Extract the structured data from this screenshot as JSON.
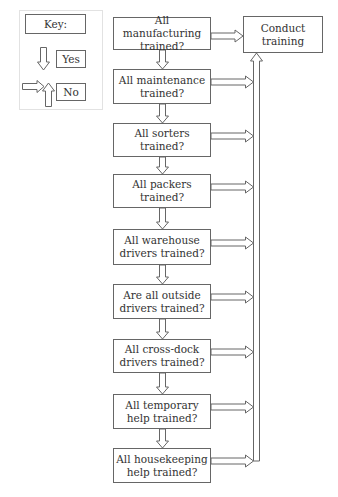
{
  "key": {
    "title": "Key:",
    "yes_label": "Yes",
    "no_label": "No",
    "yes_icon": "down-arrow",
    "no_icon": "right-then-up-arrow"
  },
  "action": {
    "label": "Conduct\ntraining"
  },
  "steps": [
    {
      "label": "All manufacturing\ntrained?"
    },
    {
      "label": "All maintenance\ntrained?"
    },
    {
      "label": "All sorters\ntrained?"
    },
    {
      "label": "All packers\ntrained?"
    },
    {
      "label": "All warehouse\ndrivers trained?"
    },
    {
      "label": "Are all outside\ndrivers trained?"
    },
    {
      "label": "All cross-dock\ndrivers trained?"
    },
    {
      "label": "All temporary\nhelp trained?"
    },
    {
      "label": "All housekeeping\nhelp trained?"
    }
  ],
  "colors": {
    "line": "#666666",
    "panel_border": "#e2e2e2"
  }
}
